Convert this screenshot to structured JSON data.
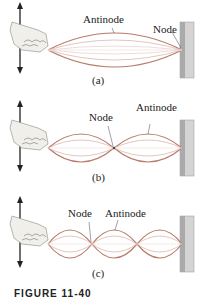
{
  "figure": {
    "panels": [
      {
        "id": "a",
        "label": "(a)",
        "loops": 1,
        "annotations": [
          "Antinode",
          "Node"
        ]
      },
      {
        "id": "b",
        "label": "(b)",
        "loops": 2,
        "annotations": [
          "Node",
          "Antinode"
        ]
      },
      {
        "id": "c",
        "label": "(c)",
        "loops": 3,
        "annotations": [
          "Node",
          "Antinode"
        ]
      }
    ],
    "caption": "FIGURE 11-40"
  },
  "colors": {
    "string_outer": "#b97a6a",
    "string_inner": "#d9b7ae",
    "wall": "#b9b9b9",
    "arrow": "#222222"
  }
}
